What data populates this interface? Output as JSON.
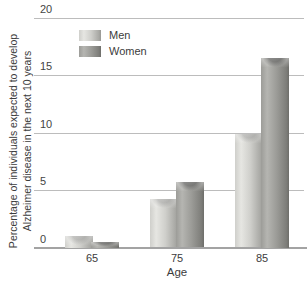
{
  "chart_data": {
    "type": "bar",
    "title": "",
    "categories": [
      "65",
      "75",
      "85"
    ],
    "series": [
      {
        "name": "Men",
        "values": [
          1.0,
          4.2,
          9.9
        ]
      },
      {
        "name": "Women",
        "values": [
          0.5,
          5.7,
          16.5
        ]
      }
    ],
    "xlabel": "Age",
    "ylabel": "Percentage of individuals expected to develop Alzheimer disease in the next 10 years",
    "ylabel_lines": [
      "Percentage of individuals expected to develop",
      "Alzheimer disease in the next 10 years"
    ],
    "ylim": [
      0,
      20
    ],
    "yticks": [
      0,
      5,
      10,
      15,
      20
    ],
    "grid": true,
    "legend_position": "top-left-inside"
  },
  "colors": {
    "background": "#ffffff",
    "gridline": "#bcbcbc",
    "axis_line": "#a3a3a3",
    "text": "#3c3c3c",
    "men_bar": {
      "light": "#e6e6e2",
      "mid": "#cfcfcb",
      "dark": "#a9a9a5",
      "edge": "#999995"
    },
    "women_bar": {
      "light": "#b5b5b1",
      "mid": "#9c9c98",
      "dark": "#7e7e7a",
      "edge": "#6e6e6a"
    }
  }
}
